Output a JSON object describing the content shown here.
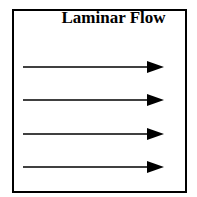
{
  "diagram": {
    "title": "Laminar Flow",
    "arrows": [
      {
        "y": 67,
        "x1": 23,
        "x2": 164,
        "direction": "right"
      },
      {
        "y": 100,
        "x1": 23,
        "x2": 164,
        "direction": "right"
      },
      {
        "y": 134,
        "x1": 23,
        "x2": 164,
        "direction": "right"
      },
      {
        "y": 167,
        "x1": 23,
        "x2": 164,
        "direction": "right"
      }
    ],
    "colors": {
      "stroke": "#000000",
      "background": "#ffffff"
    }
  }
}
